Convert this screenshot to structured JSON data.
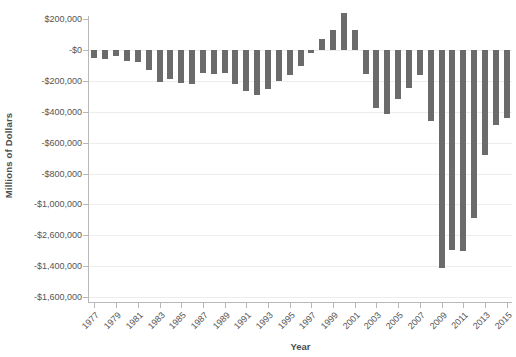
{
  "chart_data": {
    "type": "bar",
    "title": "",
    "xlabel": "Year",
    "ylabel": "Millions of Dollars",
    "grid": true,
    "legend": false,
    "bar_color": "#6b6b6b",
    "axis_color": "#b8b8b8",
    "gridline_color": "#ededed",
    "label_color": "#555555",
    "ylim": [
      -1600000,
      200000
    ],
    "y_ticks": [
      {
        "value": 200000,
        "label": "$200,000"
      },
      {
        "value": 0,
        "label": "-$0"
      },
      {
        "value": -200000,
        "label": "-$200,000"
      },
      {
        "value": -400000,
        "label": "-$400,000"
      },
      {
        "value": -600000,
        "label": "-$600,000"
      },
      {
        "value": -800000,
        "label": "-$800,000"
      },
      {
        "value": -1000000,
        "label": "-$1,000,000"
      },
      {
        "value": -1200000,
        "label": "-$2,600,000"
      },
      {
        "value": -1400000,
        "label": "-$1,400,000"
      },
      {
        "value": -1600000,
        "label": "-$1,600,000"
      }
    ],
    "x_tick_labels": [
      "1977",
      "1979",
      "1981",
      "1983",
      "1985",
      "1987",
      "1989",
      "1991",
      "1993",
      "1995",
      "1997",
      "1999",
      "2001",
      "2003",
      "2005",
      "2007",
      "2009",
      "2011",
      "2013",
      "2015"
    ],
    "categories": [
      "1977",
      "1978",
      "1979",
      "1980",
      "1981",
      "1982",
      "1983",
      "1984",
      "1985",
      "1986",
      "1987",
      "1988",
      "1989",
      "1990",
      "1991",
      "1992",
      "1993",
      "1994",
      "1995",
      "1996",
      "1997",
      "1998",
      "1999",
      "2000",
      "2001",
      "2002",
      "2003",
      "2004",
      "2005",
      "2006",
      "2007",
      "2008",
      "2009",
      "2010",
      "2011",
      "2012",
      "2013",
      "2014",
      "2015"
    ],
    "values": [
      -53700,
      -59200,
      -40700,
      -73800,
      -79000,
      -128000,
      -207800,
      -185400,
      -212300,
      -221200,
      -149700,
      -155200,
      -152600,
      -221200,
      -269200,
      -290300,
      -255100,
      -203200,
      -164000,
      -107400,
      -21900,
      69300,
      125600,
      236200,
      128200,
      -157800,
      -377600,
      -412700,
      -318300,
      -248200,
      -160700,
      -458600,
      -1412700,
      -1294400,
      -1299600,
      -1087000,
      -679500,
      -484600,
      -438400
    ]
  }
}
